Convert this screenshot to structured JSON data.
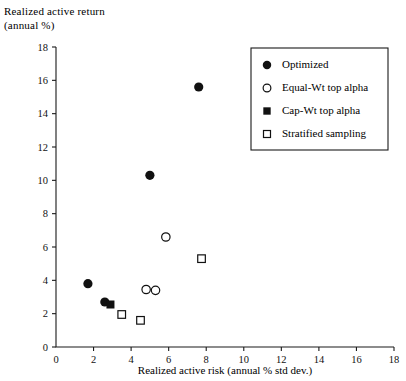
{
  "chart_data": {
    "type": "scatter",
    "title": "",
    "ylabel": "Realized active return\n(annual %)",
    "xlabel": "Realized active risk (annual % std dev.)",
    "xlim": [
      0,
      18
    ],
    "ylim": [
      0,
      18
    ],
    "xticks": [
      0,
      2,
      4,
      6,
      8,
      10,
      12,
      14,
      16,
      18
    ],
    "yticks": [
      0,
      2,
      4,
      6,
      8,
      10,
      12,
      14,
      16,
      18
    ],
    "xtick_labels": [
      "0",
      "2",
      "4",
      "6",
      "8",
      "10",
      "12",
      "14",
      "16",
      "18"
    ],
    "ytick_labels": [
      "0",
      "2",
      "4",
      "6",
      "8",
      "10",
      "12",
      "14",
      "16",
      "18"
    ],
    "grid": false,
    "legend_position": "upper right",
    "series": [
      {
        "name": "Optimized",
        "marker": "filled-circle",
        "color": "#111111",
        "points": [
          {
            "x": 7.6,
            "y": 15.6
          },
          {
            "x": 5.0,
            "y": 10.3
          },
          {
            "x": 1.7,
            "y": 3.8
          },
          {
            "x": 2.6,
            "y": 2.7
          }
        ]
      },
      {
        "name": "Equal-Wt top alpha",
        "marker": "open-circle",
        "color": "#111111",
        "points": [
          {
            "x": 5.85,
            "y": 6.6
          },
          {
            "x": 4.8,
            "y": 3.45
          },
          {
            "x": 5.3,
            "y": 3.4
          }
        ]
      },
      {
        "name": "Cap-Wt top alpha",
        "marker": "filled-square",
        "color": "#111111",
        "points": [
          {
            "x": 2.9,
            "y": 2.55
          }
        ]
      },
      {
        "name": "Stratified sampling",
        "marker": "open-square",
        "color": "#111111",
        "points": [
          {
            "x": 7.75,
            "y": 5.3
          },
          {
            "x": 3.5,
            "y": 1.95
          },
          {
            "x": 4.5,
            "y": 1.6
          }
        ]
      }
    ]
  },
  "legend": {
    "items": [
      {
        "label": "Optimized",
        "marker": "filled-circle"
      },
      {
        "label": "Equal-Wt top alpha",
        "marker": "open-circle"
      },
      {
        "label": "Cap-Wt top alpha",
        "marker": "filled-square"
      },
      {
        "label": "Stratified sampling",
        "marker": "open-square"
      }
    ]
  }
}
